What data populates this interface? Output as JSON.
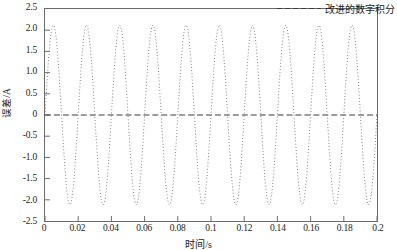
{
  "chart_data": {
    "type": "line",
    "title": "",
    "xlabel": "时间/s",
    "ylabel": "误差/A",
    "xlim": [
      0,
      0.2
    ],
    "ylim": [
      -2.5,
      2.5
    ],
    "grid": false,
    "legend_position": "top-right",
    "x_ticks": [
      "0",
      "0.02",
      "0.04",
      "0.06",
      "0.08",
      "0.1",
      "0.12",
      "0.14",
      "0.16",
      "0.18",
      "0.2"
    ],
    "x_tick_values": [
      0,
      0.02,
      0.04,
      0.06,
      0.08,
      0.1,
      0.12,
      0.14,
      0.16,
      0.18,
      0.2
    ],
    "y_ticks": [
      "2.5",
      "2.0",
      "1.5",
      "1.0",
      "0.5",
      "0",
      "-0.5",
      "-1.0",
      "-1.5",
      "-2.0",
      "-2.5"
    ],
    "y_tick_values": [
      2.5,
      2.0,
      1.5,
      1.0,
      0.5,
      0,
      -0.5,
      -1.0,
      -1.5,
      -2.0,
      -2.5
    ],
    "series": [
      {
        "name": "改进的数字积分",
        "style": "dotted",
        "color": "#808080",
        "waveform": "sine",
        "amplitude": 2.12,
        "frequency_hz": 50,
        "period_s": 0.02,
        "phase_deg": 0,
        "offset": 0.0,
        "samples_per_period": 40,
        "peak_value": 2.12,
        "trough_value": -2.12,
        "x_start": 0,
        "x_end": 0.2,
        "peaks_x": [
          0.005,
          0.025,
          0.045,
          0.065,
          0.085,
          0.105,
          0.125,
          0.145,
          0.165,
          0.185
        ],
        "troughs_x": [
          0.015,
          0.035,
          0.055,
          0.075,
          0.095,
          0.115,
          0.135,
          0.155,
          0.175,
          0.195
        ],
        "zero_crossings_x": [
          0.0,
          0.01,
          0.02,
          0.03,
          0.04,
          0.05,
          0.06,
          0.07,
          0.08,
          0.09,
          0.1,
          0.11,
          0.12,
          0.13,
          0.14,
          0.15,
          0.16,
          0.17,
          0.18,
          0.19,
          0.2
        ]
      }
    ],
    "reference_lines": [
      {
        "name": "zero-line",
        "axis": "y",
        "value": 0,
        "style": "dashed",
        "color": "#3a3a3a"
      }
    ]
  },
  "legend": {
    "entries": [
      {
        "label": "改进的数字积分",
        "color": "#3a3a3a",
        "style": "dashed"
      }
    ]
  },
  "axes": {
    "frame_color": "#6b6b6b"
  }
}
